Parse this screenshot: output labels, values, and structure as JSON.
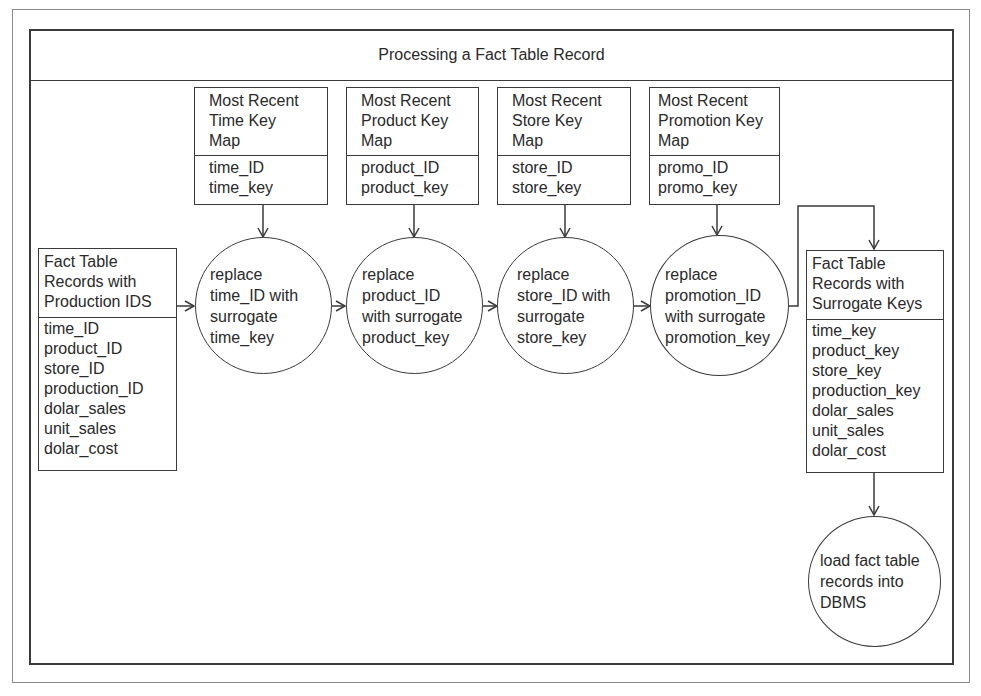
{
  "title": "Processing a Fact Table Record",
  "input_table": {
    "header": [
      "Fact Table",
      "Records with",
      "Production IDS"
    ],
    "fields": [
      "time_ID",
      "product_ID",
      "store_ID",
      "production_ID",
      "dolar_sales",
      "unit_sales",
      "dolar_cost"
    ]
  },
  "key_maps": [
    {
      "header": [
        "Most Recent",
        "Time Key",
        "Map"
      ],
      "fields": [
        "time_ID",
        "time_key"
      ]
    },
    {
      "header": [
        "Most Recent",
        "Product Key",
        "Map"
      ],
      "fields": [
        "product_ID",
        "product_key"
      ]
    },
    {
      "header": [
        "Most Recent",
        "Store Key",
        "Map"
      ],
      "fields": [
        "store_ID",
        "store_key"
      ]
    },
    {
      "header": [
        "Most Recent",
        "Promotion Key",
        "Map"
      ],
      "fields": [
        "promo_ID",
        "promo_key"
      ]
    }
  ],
  "processes": [
    {
      "lines": [
        "replace",
        "time_ID with",
        "surrogate",
        "time_key"
      ]
    },
    {
      "lines": [
        "replace",
        "product_ID",
        "with surrogate",
        "product_key"
      ]
    },
    {
      "lines": [
        "replace",
        "store_ID with",
        "surrogate",
        "store_key"
      ]
    },
    {
      "lines": [
        "replace",
        "promotion_ID",
        "with surrogate",
        "promotion_key"
      ]
    }
  ],
  "output_table": {
    "header": [
      "Fact Table",
      "Records with",
      "Surrogate Keys"
    ],
    "fields": [
      "time_key",
      "product_key",
      "store_key",
      "production_key",
      "dolar_sales",
      "unit_sales",
      "dolar_cost"
    ]
  },
  "load_process": {
    "lines": [
      "load fact table",
      "records into",
      "DBMS"
    ]
  }
}
